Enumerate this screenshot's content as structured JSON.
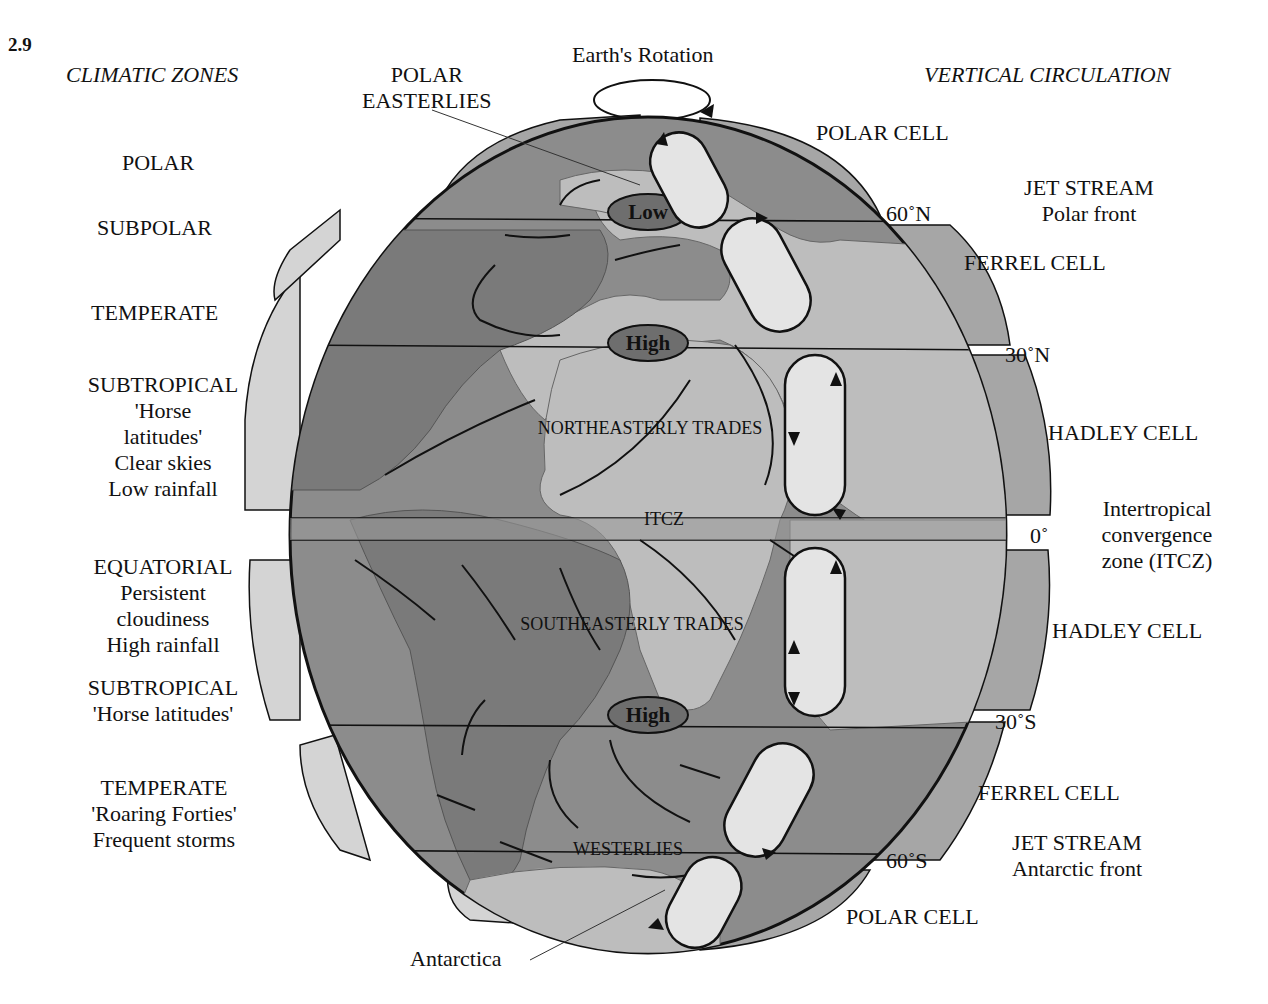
{
  "figure_number": "2.9",
  "headers": {
    "left": "CLIMATIC ZONES",
    "right": "VERTICAL CIRCULATION",
    "rotation": "Earth's Rotation",
    "polar_easterlies": [
      "POLAR",
      "EASTERLIES"
    ]
  },
  "climatic_zones": [
    {
      "lines": [
        "POLAR"
      ]
    },
    {
      "lines": [
        "SUBPOLAR"
      ]
    },
    {
      "lines": [
        "TEMPERATE"
      ]
    },
    {
      "lines": [
        "SUBTROPICAL",
        "'Horse",
        "latitudes'",
        "Clear skies",
        "Low rainfall"
      ]
    },
    {
      "lines": [
        "EQUATORIAL",
        "Persistent",
        "cloudiness",
        "High rainfall"
      ]
    },
    {
      "lines": [
        "SUBTROPICAL",
        "'Horse latitudes'"
      ]
    },
    {
      "lines": [
        "TEMPERATE",
        "'Roaring Forties'",
        "Frequent storms"
      ]
    }
  ],
  "vertical_circulation": [
    {
      "lines": [
        "POLAR CELL"
      ]
    },
    {
      "lines": [
        "JET STREAM",
        "Polar front"
      ]
    },
    {
      "lines": [
        "FERREL CELL"
      ]
    },
    {
      "lines": [
        "HADLEY CELL"
      ]
    },
    {
      "lines": [
        "Intertropical",
        "convergence",
        "zone (ITCZ)"
      ]
    },
    {
      "lines": [
        "HADLEY CELL"
      ]
    },
    {
      "lines": [
        "FERREL CELL"
      ]
    },
    {
      "lines": [
        "JET STREAM",
        "Antarctic front"
      ]
    },
    {
      "lines": [
        "POLAR CELL"
      ]
    }
  ],
  "latitudes": [
    "60˚N",
    "30˚N",
    "0˚",
    "30˚S",
    "60˚S"
  ],
  "pressure_systems": [
    "Low",
    "High",
    "High"
  ],
  "wind_labels": [
    "NORTHEASTERLY TRADES",
    "ITCZ",
    "SOUTHEASTERLY TRADES",
    "WESTERLIES"
  ],
  "callouts": {
    "antarctica": "Antarctica"
  },
  "colors": {
    "ocean": "#8c8c8c",
    "land": "#bdbdbd",
    "continent_dark": "#7a7a7a",
    "bands": "#a6a6a6",
    "cell_fill": "#dcdcdc",
    "pill": "#6e6e6e",
    "outline": "#111111"
  }
}
